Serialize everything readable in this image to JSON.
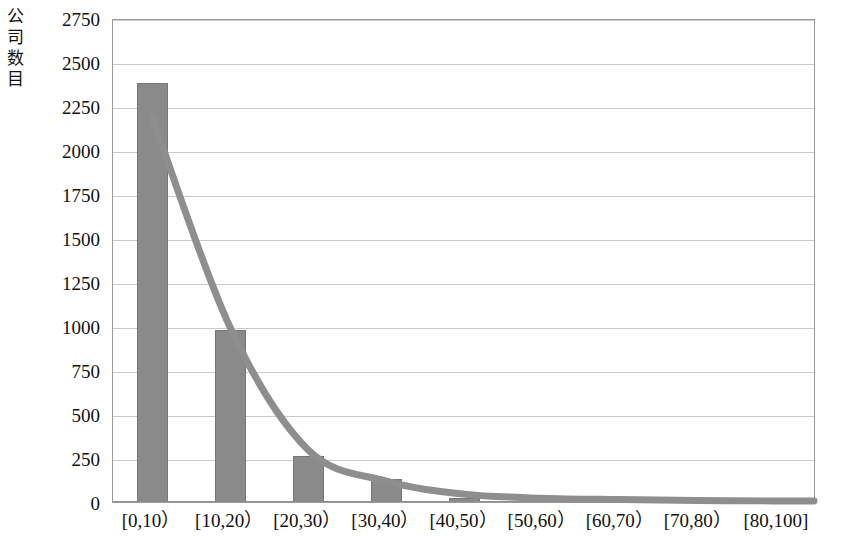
{
  "chart_data": {
    "type": "bar",
    "title": "",
    "subtitle": "",
    "xlabel": "",
    "ylabel": "公司数目",
    "categories": [
      "[0,10）",
      "[10,20）",
      "[20,30）",
      "[30,40）",
      "[40,50）",
      "[50,60）",
      "[60,70）",
      "[70,80）",
      "[80,100]"
    ],
    "values": [
      2380,
      975,
      260,
      130,
      25,
      10,
      6,
      4,
      3
    ],
    "ylim": [
      0,
      2750
    ],
    "ytick_values": [
      0,
      250,
      500,
      750,
      1000,
      1250,
      1500,
      1750,
      2000,
      2250,
      2500,
      2750
    ],
    "ytick_labels": [
      "0",
      "250",
      "500",
      "750",
      "1000",
      "1250",
      "1500",
      "1750",
      "2000",
      "2250",
      "2500",
      "2750"
    ],
    "grid": true,
    "legend": "none",
    "series": [
      {
        "name": "公司数目",
        "type": "bar",
        "color": "#8a8a8a",
        "values": [
          2380,
          975,
          260,
          130,
          25,
          10,
          6,
          4,
          3
        ]
      },
      {
        "name": "趋势线",
        "type": "line",
        "color": "#8e8e8e",
        "values": [
          2200,
          1000,
          300,
          120,
          45,
          22,
          14,
          9,
          6
        ]
      }
    ]
  },
  "axis": {
    "y_title": "公司数目",
    "tick_color": "#c9c9c9",
    "frame_color": "#9a9a9a"
  }
}
